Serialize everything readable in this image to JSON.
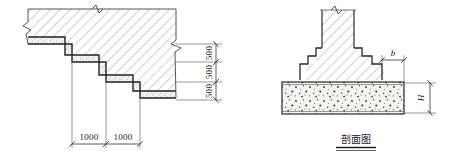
{
  "drawing": {
    "title_caption": "剖面图",
    "background_color": "#ffffff",
    "line_color": "#3a3a3a",
    "outline_color": "#222222",
    "hatch_color": "#9a9a9a",
    "stipple_color": "#555555"
  },
  "left_figure": {
    "name": "stepped-foundation-plan",
    "horizontal_dimensions": [
      {
        "label": "1000"
      },
      {
        "label": "1000"
      }
    ],
    "vertical_dimensions": [
      {
        "label": "500"
      },
      {
        "label": "500"
      },
      {
        "label": "500"
      }
    ],
    "symbols": {
      "break_top": "break-line-symbol",
      "break_left": "break-line-symbol",
      "break_right": "break-line-symbol"
    }
  },
  "right_figure": {
    "name": "stepped-foundation-section",
    "caption": "剖面图",
    "dimensions": [
      {
        "label": "b",
        "orientation": "horizontal"
      },
      {
        "label": "H",
        "orientation": "vertical"
      }
    ],
    "symbols": {
      "break_top": "break-line-symbol"
    }
  }
}
